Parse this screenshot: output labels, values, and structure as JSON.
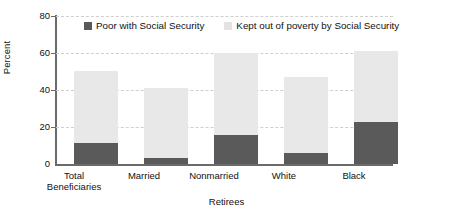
{
  "chart_data": {
    "type": "bar",
    "subtype": "stacked-vertical",
    "title": "",
    "xlabel": "Retirees",
    "ylabel": "Percent",
    "ylim": [
      0,
      80
    ],
    "yticks": [
      0,
      20,
      40,
      60,
      80
    ],
    "grid": "horizontal-dashed",
    "legend_position": "top-center",
    "categories": [
      "Total Beneficiaries",
      "Married",
      "Nonmarried",
      "White",
      "Black"
    ],
    "category_lines": [
      [
        "Total",
        "Beneficiaries"
      ],
      [
        "Married"
      ],
      [
        "Nonmarried"
      ],
      [
        "White"
      ],
      [
        "Black"
      ]
    ],
    "series": [
      {
        "name": "Poor with Social Security",
        "color": "#5a5a5a",
        "values": [
          11.3,
          3.0,
          15.5,
          6.0,
          22.5
        ]
      },
      {
        "name": "Kept out of poverty by Social Security",
        "color": "#e8e8e8",
        "values": [
          39.2,
          38.0,
          44.5,
          41.0,
          38.5
        ]
      }
    ],
    "totals": [
      50.5,
      41.0,
      60.0,
      47.0,
      61.0
    ]
  },
  "axis": {
    "y_tick_labels": [
      "80",
      "60",
      "40",
      "20",
      "0"
    ],
    "y_title": "Percent",
    "x_title": "Retirees"
  },
  "legend": {
    "items": [
      {
        "label": "Poor with Social Security",
        "swatch": "legend-swatch-dark"
      },
      {
        "label": "Kept out of poverty by Social Security",
        "swatch": "legend-swatch-light"
      }
    ]
  },
  "colors": {
    "dark": "#5a5a5a",
    "light": "#e8e8e8",
    "axis": "#6b6b6b",
    "grid": "#cfcfcf"
  }
}
